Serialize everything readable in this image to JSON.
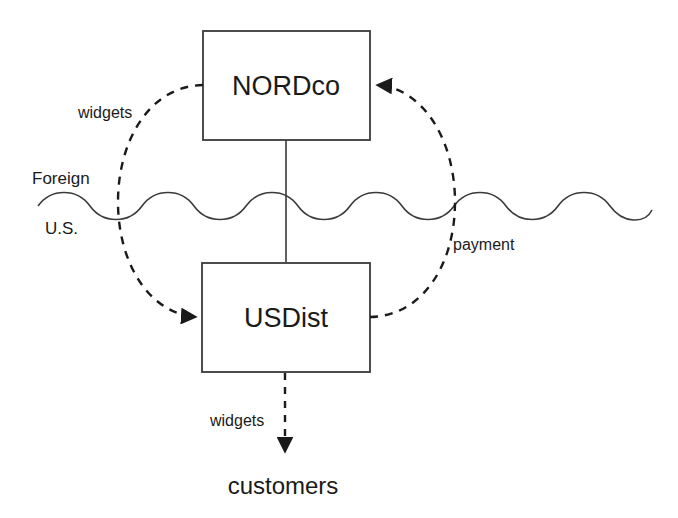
{
  "diagram": {
    "type": "flow-diagram",
    "title": "",
    "colors": {
      "stroke": "#333333",
      "text": "#1a1a1a",
      "background": "#ffffff"
    },
    "nodes": [
      {
        "id": "nordco",
        "label": "NORDco",
        "shape": "rectangle",
        "region": "Foreign"
      },
      {
        "id": "usdist",
        "label": "USDist",
        "shape": "rectangle",
        "region": "U.S."
      },
      {
        "id": "customers",
        "label": "customers",
        "shape": "text",
        "region": "U.S."
      }
    ],
    "regions": [
      {
        "id": "foreign",
        "label": "Foreign"
      },
      {
        "id": "us",
        "label": "U.S."
      }
    ],
    "border": {
      "style": "wavy-line",
      "meaning": "national border between Foreign and U.S."
    },
    "edges": [
      {
        "id": "nordco-to-usdist",
        "label": "widgets",
        "from": "NORDco",
        "to": "USDist",
        "style": "dashed-curve",
        "arrow": "to-usdist"
      },
      {
        "id": "usdist-to-nordco",
        "label": "payment",
        "from": "USDist",
        "to": "NORDco",
        "style": "dashed-curve",
        "arrow": "to-nordco"
      },
      {
        "id": "nordco-usdist-ownership",
        "label": "",
        "from": "NORDco",
        "to": "USDist",
        "style": "solid-line",
        "arrow": "none"
      },
      {
        "id": "usdist-to-customers",
        "label": "widgets",
        "from": "USDist",
        "to": "customers",
        "style": "dashed-line",
        "arrow": "to-customers"
      }
    ]
  }
}
